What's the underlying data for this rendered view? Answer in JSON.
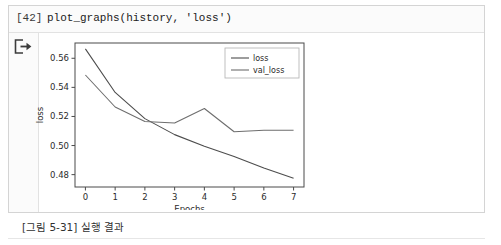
{
  "cell": {
    "prompt": "[42]",
    "code": "plot_graphs(history, 'loss')",
    "output_icon": "output-export-arrow-icon"
  },
  "caption": "[그림 5-31] 실행 결과",
  "colors": {
    "line_loss": "#4d4d4d",
    "line_val_loss": "#6e6e6e",
    "axis": "#3a3a3a",
    "cell_border": "#d4d4d4",
    "gutter_bg": "#fbfbfb"
  },
  "chart_data": {
    "type": "line",
    "title": "",
    "xlabel": "Epochs",
    "ylabel": "loss",
    "x": [
      0,
      1,
      2,
      3,
      4,
      5,
      6,
      7
    ],
    "xlim": [
      -0.35,
      7.35
    ],
    "ylim": [
      0.4715,
      0.5705
    ],
    "xticks": [
      0,
      1,
      2,
      3,
      4,
      5,
      6,
      7
    ],
    "xticklabels": [
      "0",
      "1",
      "2",
      "3",
      "4",
      "5",
      "6",
      "7"
    ],
    "yticks": [
      0.48,
      0.5,
      0.52,
      0.54,
      0.56
    ],
    "yticklabels": [
      "0.48",
      "0.50",
      "0.52",
      "0.54",
      "0.56"
    ],
    "grid": false,
    "legend_position": "upper right",
    "series": [
      {
        "name": "loss",
        "color": "#4d4d4d",
        "values": [
          0.5665,
          0.5365,
          0.5185,
          0.5075,
          0.4995,
          0.4925,
          0.4845,
          0.4775
        ]
      },
      {
        "name": "val_loss",
        "color": "#6e6e6e",
        "values": [
          0.5485,
          0.5265,
          0.5165,
          0.5155,
          0.5255,
          0.5095,
          0.5105,
          0.5105
        ]
      }
    ]
  }
}
